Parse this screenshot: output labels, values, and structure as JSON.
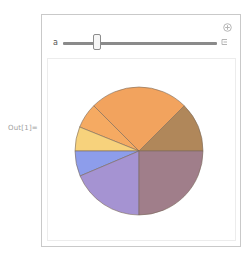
{
  "notebook": {
    "output_label": "Out[1]="
  },
  "manipulate": {
    "slider": {
      "variable_label": "a",
      "value_fraction": 0.22
    },
    "icons": {
      "add": "plus-circle-icon",
      "options": "bracket-icon"
    }
  },
  "chart_data": {
    "type": "pie",
    "title": "",
    "start_angle_deg": 0,
    "direction": "counterclockwise",
    "slices": [
      {
        "label": "",
        "angle_deg": 45,
        "fraction": 0.125,
        "color": "#b0875a"
      },
      {
        "label": "",
        "angle_deg": 90,
        "fraction": 0.25,
        "color": "#f2a35e"
      },
      {
        "label": "",
        "angle_deg": 23,
        "fraction": 0.0639,
        "color": "#f5aa62"
      },
      {
        "label": "",
        "angle_deg": 22,
        "fraction": 0.0611,
        "color": "#f7d27c"
      },
      {
        "label": "",
        "angle_deg": 23,
        "fraction": 0.0639,
        "color": "#8d9deb"
      },
      {
        "label": "",
        "angle_deg": 67,
        "fraction": 0.1861,
        "color": "#a593d2"
      },
      {
        "label": "",
        "angle_deg": 90,
        "fraction": 0.25,
        "color": "#a07e8a"
      }
    ],
    "edge_color": "#7a6a5a"
  }
}
